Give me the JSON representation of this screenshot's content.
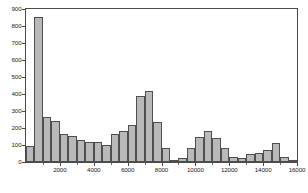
{
  "chart_data": {
    "type": "bar",
    "title": "",
    "subtitle": "",
    "xlabel": "",
    "ylabel": "",
    "grid": false,
    "legend": null,
    "legend_position": "none",
    "bar_style": {
      "fill": "#b9b9b9",
      "edge": "#4f4f4f",
      "bin_width": 500
    },
    "axes": {
      "background": "#ffffff",
      "frame_color": "#4a4a4a",
      "x_range": [
        0,
        16000
      ],
      "y_range": [
        0,
        900
      ],
      "x_tick_labels": [
        "2000",
        "4000",
        "6000",
        "8000",
        "10000",
        "12000",
        "14000",
        "16000"
      ],
      "x_tick_values": [
        2000,
        4000,
        6000,
        8000,
        10000,
        12000,
        14000,
        16000
      ],
      "x_minor_tick_values": [
        1000,
        3000,
        5000,
        7000,
        9000,
        11000,
        13000,
        15000
      ],
      "y_tick_labels": [
        "0",
        "100",
        "200",
        "300",
        "400",
        "500",
        "600",
        "700",
        "800",
        "900"
      ],
      "y_tick_values": [
        0,
        100,
        200,
        300,
        400,
        500,
        600,
        700,
        800,
        900
      ]
    },
    "bin_edges": [
      0,
      500,
      1000,
      1500,
      2000,
      2500,
      3000,
      3500,
      4000,
      4500,
      5000,
      5500,
      6000,
      6500,
      7000,
      7500,
      8000,
      8500,
      9000,
      9500,
      10000,
      10500,
      11000,
      11500,
      12000,
      12500,
      13000,
      13500,
      14000,
      14500,
      15000,
      15500,
      16000
    ],
    "bin_centers": [
      250,
      750,
      1250,
      1750,
      2250,
      2750,
      3250,
      3750,
      4250,
      4750,
      5250,
      5750,
      6250,
      6750,
      7250,
      7750,
      8250,
      8750,
      9250,
      9750,
      10250,
      10750,
      11250,
      11750,
      12250,
      12750,
      13250,
      13750,
      14250,
      14750,
      15250,
      15750
    ],
    "x": [
      250,
      750,
      1250,
      1750,
      2250,
      2750,
      3250,
      3750,
      4250,
      4750,
      5250,
      5750,
      6250,
      6750,
      7250,
      7750,
      8250,
      8750,
      9250,
      9750,
      10250,
      10750,
      11250,
      11750,
      12250,
      12750,
      13250,
      13750,
      14250,
      14750,
      15250,
      15750
    ],
    "categories": [
      "0-500",
      "500-1000",
      "1000-1500",
      "1500-2000",
      "2000-2500",
      "2500-3000",
      "3000-3500",
      "3500-4000",
      "4000-4500",
      "4500-5000",
      "5000-5500",
      "5500-6000",
      "6000-6500",
      "6500-7000",
      "7000-7500",
      "7500-8000",
      "8000-8500",
      "8500-9000",
      "9000-9500",
      "9500-10000",
      "10000-10500",
      "10500-11000",
      "11000-11500",
      "11500-12000",
      "12000-12500",
      "12500-13000",
      "13000-13500",
      "13500-14000",
      "14000-14500",
      "14500-15000",
      "15000-15500",
      "15500-16000"
    ],
    "values": [
      95,
      855,
      265,
      240,
      165,
      155,
      130,
      120,
      115,
      100,
      165,
      180,
      215,
      390,
      415,
      235,
      85,
      12,
      25,
      80,
      145,
      180,
      140,
      80,
      30,
      22,
      45,
      52,
      68,
      110,
      30,
      8
    ],
    "ylim": [
      0,
      900
    ],
    "xlim": [
      0,
      16000
    ]
  }
}
